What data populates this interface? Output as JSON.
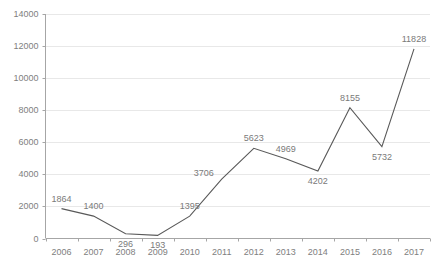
{
  "chart_data": {
    "type": "line",
    "title": "",
    "subtitle": "",
    "xlabel": "",
    "ylabel": "",
    "categories": [
      "2006",
      "2007",
      "2008",
      "2009",
      "2010",
      "2011",
      "2012",
      "2013",
      "2014",
      "2015",
      "2016",
      "2017"
    ],
    "values": [
      1864,
      1400,
      296,
      193,
      1395,
      3706,
      5623,
      4969,
      4202,
      8155,
      5732,
      11828
    ],
    "series": [
      {
        "name": "",
        "values": [
          1864,
          1400,
          296,
          193,
          1395,
          3706,
          5623,
          4969,
          4202,
          8155,
          5732,
          11828
        ]
      }
    ],
    "point_labels": [
      "1864",
      "1400",
      "296",
      "193",
      "1395",
      "3706",
      "5623",
      "4969",
      "4202",
      "8155",
      "5732",
      "11828"
    ],
    "label_positions": [
      "above",
      "above",
      "below",
      "below",
      "above",
      "left",
      "above",
      "above",
      "below",
      "above",
      "below",
      "above"
    ],
    "ylim": [
      0,
      14000
    ],
    "yticks": [
      0,
      2000,
      4000,
      6000,
      8000,
      10000,
      12000,
      14000
    ],
    "ytick_labels": [
      "0",
      "2000",
      "4000",
      "6000",
      "8000",
      "10000",
      "12000",
      "14000"
    ],
    "xtick_labels": [
      "2006",
      "2007",
      "2008",
      "2009",
      "2010",
      "2011",
      "2012",
      "2013",
      "2014",
      "2015",
      "2016",
      "2017"
    ],
    "grid": "horizontal",
    "legend": "none",
    "markers": "none",
    "colors": {
      "line": "#595959",
      "grid": "#e8e8e8",
      "axis": "#a6a6a6",
      "tick_text": "#808080",
      "label_text": "#7a7a7a",
      "background": "#ffffff"
    }
  }
}
